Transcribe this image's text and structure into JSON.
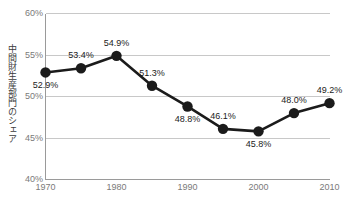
{
  "chart_data": {
    "type": "line",
    "title": "",
    "xlabel": "",
    "ylabel": "中間財生産部門のシェア",
    "x": [
      1970,
      1975,
      1980,
      1985,
      1990,
      1995,
      2000,
      2005,
      2010
    ],
    "values": [
      52.9,
      53.4,
      54.9,
      51.3,
      48.8,
      46.1,
      45.8,
      48.0,
      49.2
    ],
    "point_labels": [
      "52.9%",
      "53.4%",
      "54.9%",
      "51.3%",
      "48.8%",
      "46.1%",
      "45.8%",
      "48.0%",
      "49.2%"
    ],
    "label_positions": [
      "below",
      "above",
      "above",
      "above",
      "below",
      "above",
      "below",
      "above",
      "above"
    ],
    "xtick_labels": [
      "1970",
      "1980",
      "1990",
      "2000",
      "2010"
    ],
    "xtick_values": [
      1970,
      1980,
      1990,
      2000,
      2010
    ],
    "ytick_labels": [
      "60%",
      "55%",
      "50%",
      "45%",
      "40%"
    ],
    "ytick_values": [
      60,
      55,
      50,
      45,
      40
    ],
    "ylim": [
      40,
      60
    ],
    "xlim": [
      1970,
      2010
    ],
    "grid": true,
    "grid_axis": "y",
    "legend": false,
    "legend_position": "none",
    "series_color": "#1b1b1b",
    "grid_color": "#c8c8c8",
    "axis_color": "#9a9a9a",
    "tick_text_color": "#7a7a7a",
    "label_text_color": "#1b1b1b",
    "background_color": "#ffffff",
    "marker": "circle",
    "marker_size": 5.2,
    "line_width": 2.6
  }
}
